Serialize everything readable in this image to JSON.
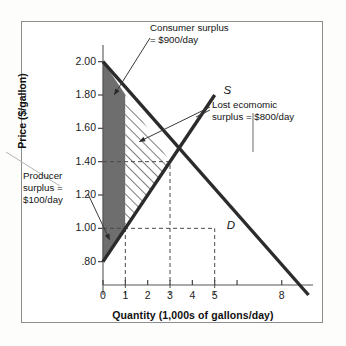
{
  "figure": {
    "background": "#ffffff",
    "frame_color": "#8d8d8d"
  },
  "chart_data": {
    "type": "line",
    "title": "",
    "xlabel": "Quantity (1,000s of gallons/day)",
    "ylabel": "Price ($/gallon)",
    "xlim": [
      0,
      9.4
    ],
    "ylim": [
      0.6,
      2.1
    ],
    "grid": false,
    "legend_position": "inline-curve-labels",
    "x_ticks": [
      {
        "value": 0,
        "label": "0"
      },
      {
        "value": 1,
        "label": "1"
      },
      {
        "value": 2,
        "label": "2"
      },
      {
        "value": 3,
        "label": "3"
      },
      {
        "value": 4,
        "label": "4"
      },
      {
        "value": 5,
        "label": "5"
      },
      {
        "value": 6,
        "label": ""
      },
      {
        "value": 8,
        "label": "8"
      }
    ],
    "y_ticks": [
      {
        "value": 2.0,
        "label": "2.00"
      },
      {
        "value": 1.8,
        "label": "1.80"
      },
      {
        "value": 1.6,
        "label": "1.60"
      },
      {
        "value": 1.4,
        "label": "1.40"
      },
      {
        "value": 1.2,
        "label": "1.20"
      },
      {
        "value": 1.0,
        "label": "1.00"
      },
      {
        "value": 0.8,
        "label": ".80"
      }
    ],
    "series": [
      {
        "name": "S",
        "label": "S",
        "type": "supply",
        "points": [
          [
            0,
            0.8
          ],
          [
            5.0,
            1.8
          ]
        ],
        "color": "#2b2b2b"
      },
      {
        "name": "D",
        "label": "D",
        "type": "demand",
        "points": [
          [
            0,
            2.0
          ],
          [
            9.2,
            0.6
          ]
        ],
        "color": "#2b2b2b"
      }
    ],
    "equilibrium": {
      "quantity": 3,
      "price": 1.4
    },
    "regulated_outcome": {
      "quantity": 1,
      "price": 1.0
    },
    "reference_lines": [
      {
        "orientation": "horizontal",
        "value": 1.4,
        "from_x": 0,
        "to_x": 3,
        "style": "dashed"
      },
      {
        "orientation": "vertical",
        "value": 3,
        "from_y": 0.6,
        "to_y": 1.4,
        "style": "dashed"
      },
      {
        "orientation": "horizontal",
        "value": 1.0,
        "from_x": 0,
        "to_x": 5,
        "style": "dashed"
      },
      {
        "orientation": "vertical",
        "value": 1,
        "from_y": 0.6,
        "to_y": 1.0,
        "style": "dashed"
      },
      {
        "orientation": "vertical",
        "value": 5,
        "from_y": 0.6,
        "to_y": 1.0,
        "style": "dashed"
      }
    ],
    "regions": [
      {
        "name": "consumer-surplus",
        "fill": "solid-dark-gray",
        "color": "#6e6e6e",
        "vertices": [
          [
            0,
            2.0
          ],
          [
            1,
            1.8
          ],
          [
            1,
            1.0
          ],
          [
            0,
            0.8
          ]
        ],
        "value": "$900/day"
      },
      {
        "name": "lost-economic-surplus",
        "fill": "diagonal-hatch",
        "color": "#2b2b2b",
        "vertices": [
          [
            1,
            1.8
          ],
          [
            3,
            1.4
          ],
          [
            1,
            1.0
          ]
        ],
        "value": "$800/day"
      },
      {
        "name": "producer-surplus",
        "fill": "solid-dark-gray",
        "color": "#6e6e6e",
        "vertices": [
          [
            0,
            1.0
          ],
          [
            1,
            1.0
          ],
          [
            0,
            0.8
          ]
        ],
        "value": "$100/day"
      }
    ],
    "annotations": [
      {
        "name": "consumer-surplus-note",
        "line1": "Consumer surplus",
        "line2": "= $900/day",
        "points_to": [
          0.55,
          1.82
        ]
      },
      {
        "name": "lost-economic-surplus-note",
        "line1": "Lost ecomomic",
        "line2": "surplus = $800/day",
        "points_to": [
          1.6,
          1.52
        ]
      },
      {
        "name": "producer-surplus-note",
        "line1": "Producer",
        "line2": "surplus =",
        "line3": "$100/day",
        "points_to": [
          0.25,
          0.92
        ]
      }
    ],
    "curve_labels": [
      {
        "name": "supply-curve-label",
        "text": "S",
        "at": [
          5.3,
          1.82
        ]
      },
      {
        "name": "demand-curve-label",
        "text": "D",
        "at": [
          5.45,
          1.01
        ]
      }
    ]
  }
}
